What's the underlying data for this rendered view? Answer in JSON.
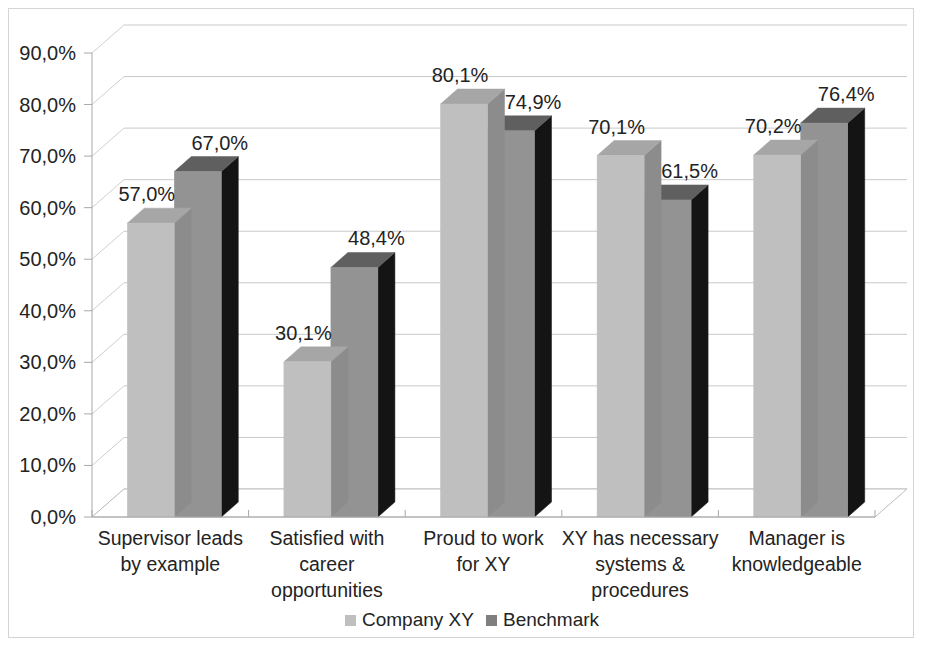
{
  "chart_data": {
    "type": "bar",
    "title": "",
    "subtitle": "",
    "xlabel": "",
    "ylabel": "",
    "ylim": [
      0,
      90
    ],
    "ytick_values": [
      0,
      10,
      20,
      30,
      40,
      50,
      60,
      70,
      80,
      90
    ],
    "ytick_labels": [
      "0,0%",
      "10,0%",
      "20,0%",
      "30,0%",
      "40,0%",
      "50,0%",
      "60,0%",
      "70,0%",
      "80,0%",
      "90,0%"
    ],
    "grid": true,
    "three_d": true,
    "legend_position": "bottom",
    "categories": [
      "Supervisor leads by example",
      "Satisfied with career opportunities",
      "Proud to work for XY",
      "XY has necessary systems & procedures",
      "Manager is knowledgeable"
    ],
    "category_lines": [
      [
        "Supervisor leads",
        "by example"
      ],
      [
        "Satisfied with",
        "career",
        "opportunities"
      ],
      [
        "Proud to work",
        "for XY"
      ],
      [
        "XY has necessary",
        "systems &",
        "procedures"
      ],
      [
        "Manager is",
        "knowledgeable"
      ]
    ],
    "series": [
      {
        "name": "Company XY",
        "color": "#bfbfbf",
        "top_color": "#a6a6a6",
        "side_color": "#8c8c8c",
        "values": [
          57.0,
          30.1,
          80.1,
          70.1,
          70.2
        ],
        "labels": [
          "57,0%",
          "30,1%",
          "80,1%",
          "70,1%",
          "70,2%"
        ]
      },
      {
        "name": "Benchmark",
        "color": "#939393",
        "top_color": "#5f5f5f",
        "side_color": "#141414",
        "values": [
          67.0,
          48.4,
          74.9,
          61.5,
          76.4
        ],
        "labels": [
          "67,0%",
          "48,4%",
          "74,9%",
          "61,5%",
          "76,4%"
        ]
      }
    ]
  },
  "legend": {
    "items": [
      {
        "label": "Company XY",
        "color": "#bfbfbf"
      },
      {
        "label": "Benchmark",
        "color": "#7f7f7f"
      }
    ]
  },
  "colors": {
    "plot_background": "#ffffff",
    "gridline": "#c9c9c9",
    "frame_border": "#d4d4d4",
    "text": "#232323"
  }
}
